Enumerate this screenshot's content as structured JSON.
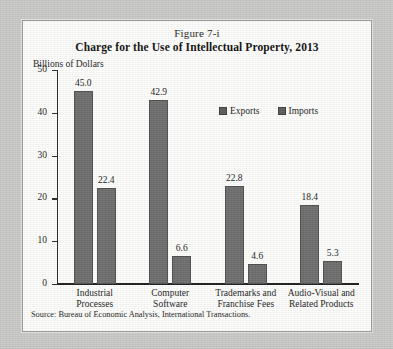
{
  "figure": {
    "label": "Figure 7-i",
    "title": "Charge for the Use of Intellectual Property, 2013",
    "axis_unit": "Billions of Dollars",
    "source": "Source: Bureau of Economic Analysis, International Transactions."
  },
  "legend": {
    "items": [
      {
        "label": "Exports",
        "color": "#5d5d5d"
      },
      {
        "label": "Imports",
        "color": "#5d5d5d"
      }
    ]
  },
  "y_axis": {
    "ticks": [
      "0",
      "10",
      "20",
      "30",
      "40",
      "50"
    ]
  },
  "chart_data": {
    "type": "bar",
    "title": "Charge for the Use of Intellectual Property, 2013",
    "subtitle": "Figure 7-i",
    "xlabel": "",
    "ylabel": "Billions of Dollars",
    "ylim": [
      0,
      50
    ],
    "yticks": [
      0,
      10,
      20,
      30,
      40,
      50
    ],
    "grid": false,
    "legend_position": "top-right",
    "categories": [
      "Industrial Processes",
      "Computer Software",
      "Trademarks and Franchise Fees",
      "Audio-Visual and Related Products"
    ],
    "category_lines": [
      [
        "Industrial Processes"
      ],
      [
        "Computer",
        "Software"
      ],
      [
        "Trademarks and",
        "Franchise Fees"
      ],
      [
        "Audio-Visual and",
        "Related Products"
      ]
    ],
    "series": [
      {
        "name": "Exports",
        "values": [
          45.0,
          42.9,
          22.8,
          18.4
        ],
        "color": "#6e6e6e"
      },
      {
        "name": "Imports",
        "values": [
          22.4,
          6.6,
          4.6,
          5.3
        ],
        "color": "#6e6e6e"
      }
    ],
    "data_labels": [
      "45.0",
      "22.4",
      "42.9",
      "6.6",
      "22.8",
      "4.6",
      "18.4",
      "5.3"
    ],
    "source": "Source: Bureau of Economic Analysis, International Transactions."
  }
}
